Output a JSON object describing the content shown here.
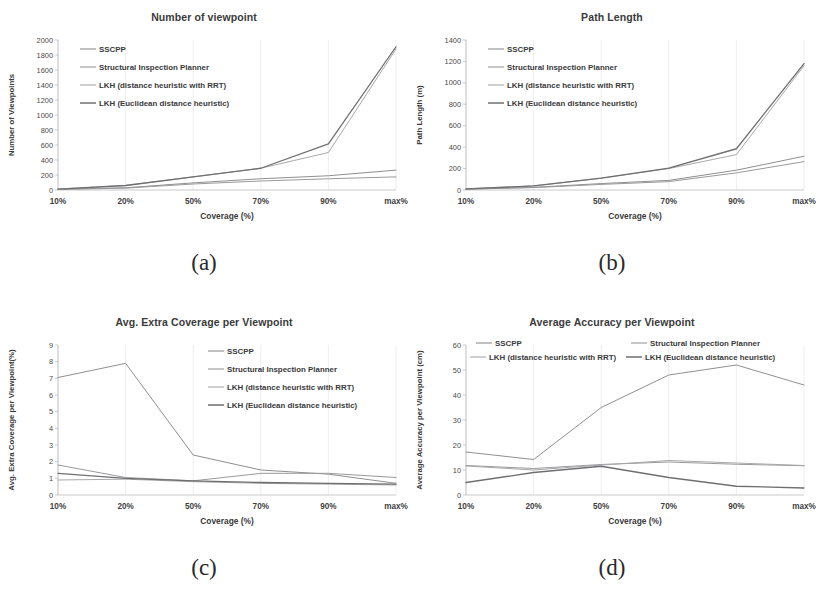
{
  "series_names": [
    "SSCPP",
    "Structural Inspection Planner",
    "LKH (distance heuristic with RRT)",
    "LKH (Euclidean distance heuristic)"
  ],
  "series_colors": [
    "#8f8f92",
    "#9a9a9d",
    "#a8a8ab",
    "#6f6f72"
  ],
  "common": {
    "xlabel": "Coverage (%)",
    "categories": [
      "10%",
      "20%",
      "50%",
      "70%",
      "90%",
      "max%"
    ]
  },
  "panels": [
    {
      "key": "a",
      "sublabel": "(a)",
      "title": "Number of viewpoint",
      "ylabel": "Number of Viewpoints",
      "legend_layout": "left-column",
      "yticks": [
        "0",
        "200",
        "400",
        "600",
        "800",
        "1000",
        "1200",
        "1400",
        "1600",
        "1800",
        "2000"
      ]
    },
    {
      "key": "b",
      "sublabel": "(b)",
      "title": "Path Length",
      "ylabel": "Path Length (m)",
      "legend_layout": "left-column",
      "yticks": [
        "0",
        "200",
        "400",
        "600",
        "800",
        "1000",
        "1200",
        "1400"
      ]
    },
    {
      "key": "c",
      "sublabel": "(c)",
      "title": "Avg. Extra Coverage per Viewpoint",
      "ylabel": "Avg. Extra Coverage  per Viewpoint(%)",
      "legend_layout": "right-column",
      "yticks": [
        "0",
        "1",
        "2",
        "3",
        "4",
        "5",
        "6",
        "7",
        "8",
        "9"
      ]
    },
    {
      "key": "d",
      "sublabel": "(d)",
      "title": "Average Accuracy per Viewpoint",
      "ylabel": "Average Accuracy per Viewpoint (cm)",
      "legend_layout": "two-column",
      "yticks": [
        "0",
        "10",
        "20",
        "30",
        "40",
        "50",
        "60"
      ]
    }
  ],
  "chart_data": [
    {
      "id": "a",
      "type": "line",
      "title": "Number of viewpoint",
      "xlabel": "Coverage (%)",
      "ylabel": "Number of Viewpoints",
      "categories": [
        "10%",
        "20%",
        "50%",
        "70%",
        "90%",
        "max%"
      ],
      "ylim": [
        0,
        2000
      ],
      "ytick_step": 200,
      "grid": true,
      "legend_position": "upper-left-inside",
      "series": [
        {
          "name": "SSCPP",
          "values": [
            10,
            30,
            95,
            150,
            190,
            265
          ]
        },
        {
          "name": "Structural Inspection Planner",
          "values": [
            8,
            25,
            80,
            120,
            150,
            175
          ]
        },
        {
          "name": "LKH (distance heuristic with RRT)",
          "values": [
            12,
            60,
            175,
            290,
            500,
            1880
          ]
        },
        {
          "name": "LKH (Euclidean distance heuristic)",
          "values": [
            12,
            60,
            175,
            290,
            615,
            1910
          ]
        }
      ]
    },
    {
      "id": "b",
      "type": "line",
      "title": "Path Length",
      "xlabel": "Coverage (%)",
      "ylabel": "Path Length (m)",
      "categories": [
        "10%",
        "20%",
        "50%",
        "70%",
        "90%",
        "max%"
      ],
      "ylim": [
        0,
        1400
      ],
      "ytick_step": 200,
      "grid": true,
      "legend_position": "upper-left-inside",
      "series": [
        {
          "name": "SSCPP",
          "values": [
            8,
            25,
            60,
            90,
            185,
            315
          ]
        },
        {
          "name": "Structural Inspection Planner",
          "values": [
            8,
            22,
            52,
            78,
            160,
            265
          ]
        },
        {
          "name": "LKH (distance heuristic with RRT)",
          "values": [
            10,
            38,
            110,
            200,
            330,
            1160
          ]
        },
        {
          "name": "LKH (Euclidean distance heuristic)",
          "values": [
            10,
            38,
            110,
            205,
            385,
            1180
          ]
        }
      ]
    },
    {
      "id": "c",
      "type": "line",
      "title": "Avg. Extra Coverage per Viewpoint",
      "xlabel": "Coverage (%)",
      "ylabel": "Avg. Extra Coverage  per Viewpoint(%)",
      "categories": [
        "10%",
        "20%",
        "50%",
        "70%",
        "90%",
        "max%"
      ],
      "ylim": [
        0,
        9
      ],
      "ytick_step": 1,
      "grid": true,
      "legend_position": "upper-right-inside",
      "series": [
        {
          "name": "SSCPP",
          "values": [
            7.05,
            7.9,
            2.4,
            1.5,
            1.25,
            0.7
          ]
        },
        {
          "name": "Structural Inspection Planner",
          "values": [
            1.8,
            1.05,
            0.85,
            1.3,
            1.3,
            1.05
          ]
        },
        {
          "name": "LKH (distance heuristic with RRT)",
          "values": [
            0.9,
            0.95,
            0.8,
            0.7,
            0.65,
            0.6
          ]
        },
        {
          "name": "LKH (Euclidean distance heuristic)",
          "values": [
            1.3,
            1.0,
            0.85,
            0.75,
            0.7,
            0.65
          ]
        }
      ]
    },
    {
      "id": "d",
      "type": "line",
      "title": "Average Accuracy per Viewpoint",
      "xlabel": "Coverage (%)",
      "ylabel": "Average Accuracy per Viewpoint (cm)",
      "categories": [
        "10%",
        "20%",
        "50%",
        "70%",
        "90%",
        "max%"
      ],
      "ylim": [
        0,
        60
      ],
      "ytick_step": 10,
      "grid": true,
      "legend_position": "top-two-column-inside",
      "series": [
        {
          "name": "SSCPP",
          "values": [
            17.2,
            14.2,
            35.0,
            48.0,
            52.0,
            44.0
          ]
        },
        {
          "name": "Structural Inspection Planner",
          "values": [
            11.8,
            10.6,
            12.2,
            13.2,
            12.3,
            11.7
          ]
        },
        {
          "name": "LKH (distance heuristic with RRT)",
          "values": [
            11.6,
            10.0,
            12.0,
            13.8,
            12.8,
            11.8
          ]
        },
        {
          "name": "LKH (Euclidean distance heuristic)",
          "values": [
            5.0,
            9.0,
            11.5,
            7.0,
            3.5,
            2.8
          ]
        }
      ]
    }
  ]
}
